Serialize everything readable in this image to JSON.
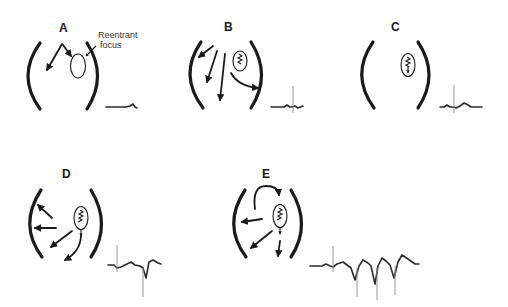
{
  "diagram": {
    "panels": [
      {
        "id": "A",
        "label": "A",
        "annotation_line1": "Reentrant",
        "annotation_line2": "focus",
        "ecg": "flat baseline with small terminal deflection"
      },
      {
        "id": "B",
        "label": "B",
        "ecg": "small spike"
      },
      {
        "id": "C",
        "label": "C",
        "ecg": "small spike with low waves"
      },
      {
        "id": "D",
        "label": "D",
        "ecg": "spike followed by one negative ventricular complex"
      },
      {
        "id": "E",
        "label": "E",
        "ecg": "spike followed by three negative ventricular complexes"
      }
    ]
  },
  "colors": {
    "ink": "#1a1a1a",
    "ecg": "#2a2a2a",
    "background": "#ffffff"
  }
}
